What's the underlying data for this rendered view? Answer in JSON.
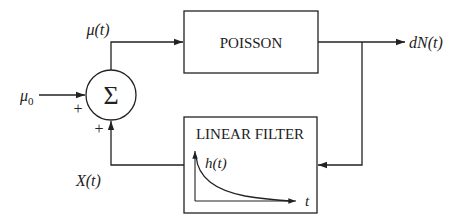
{
  "diagram": {
    "blocks": {
      "poisson": {
        "label": "POISSON"
      },
      "filter": {
        "label": "LINEAR FILTER",
        "plot_ylabel": "h(t)",
        "plot_xlabel": "t"
      },
      "summer": {
        "symbol": "Σ",
        "sign_left": "+",
        "sign_bottom": "+"
      }
    },
    "signals": {
      "input": "μ",
      "input_sub": "0",
      "rate": "μ(t)",
      "output": "dN(t)",
      "feedback": "X(t)"
    },
    "colors": {
      "stroke": "#222222",
      "background": "#ffffff"
    }
  }
}
